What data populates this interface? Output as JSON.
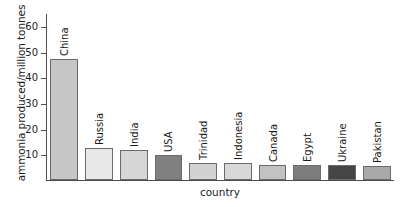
{
  "chart_data": {
    "type": "bar",
    "title": "",
    "xlabel": "country",
    "ylabel": "ammonia produced/million tonnes",
    "categories": [
      "China",
      "Russia",
      "India",
      "USA",
      "Trinidad",
      "Indonesia",
      "Canada",
      "Egypt",
      "Ukraine",
      "Pakistan"
    ],
    "values": [
      47,
      12.5,
      11.5,
      9.7,
      6.5,
      6.5,
      5.8,
      5.8,
      5.7,
      5.5
    ],
    "bar_colors": [
      "#c6c6c6",
      "#e8e8e8",
      "#d6d6d6",
      "#808080",
      "#d2d2d2",
      "#d8d8d8",
      "#c2c2c2",
      "#7d7d7d",
      "#454545",
      "#a9a9a9"
    ],
    "bar_border_color": "#6b6b6b",
    "ylim": [
      0,
      65
    ],
    "yticks": [
      10,
      20,
      30,
      40,
      50,
      60
    ],
    "ytick_labels": [
      "10",
      "20",
      "30",
      "40",
      "50",
      "60"
    ],
    "grid": false,
    "legend": false,
    "axis_color": "#4d4d4d",
    "background": "#ffffff"
  }
}
